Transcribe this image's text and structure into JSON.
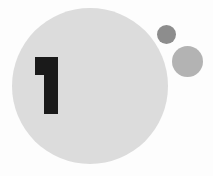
{
  "canvas": {
    "width": 213,
    "height": 176,
    "background_color": "#fdfdfd"
  },
  "graphic": {
    "title": "Step one circular badge",
    "numeral": "1",
    "numeral_color": "#1a1a1a",
    "shapes": [
      {
        "name": "primary-circle",
        "role": "badge background",
        "color": "#dcdcdc",
        "center_x": 90,
        "center_y": 86,
        "diameter": 156
      },
      {
        "name": "accent-circle-dark",
        "role": "small accent dot",
        "color": "#8d8d8d",
        "center_x": 166,
        "center_y": 34,
        "diameter": 19
      },
      {
        "name": "accent-circle-medium",
        "role": "medium accent dot",
        "color": "#b3b3b3",
        "center_x": 187,
        "center_y": 61,
        "diameter": 31
      }
    ]
  }
}
